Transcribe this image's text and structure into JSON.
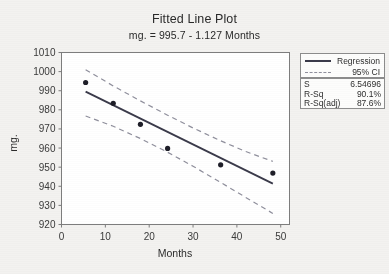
{
  "chart_data": {
    "type": "scatter",
    "title": "Fitted Line Plot",
    "subtitle": "mg.  = 995.7 - 1.127 Months",
    "xlabel": "Months",
    "ylabel": "mg.",
    "xlim": [
      0,
      52
    ],
    "ylim": [
      920,
      1010
    ],
    "xticks": [
      0,
      10,
      20,
      30,
      40,
      50
    ],
    "yticks": [
      920,
      930,
      940,
      950,
      960,
      970,
      980,
      990,
      1000,
      1010
    ],
    "grid": false,
    "legend_position": "right",
    "points": [
      {
        "x": 5.5,
        "y": 994.3
      },
      {
        "x": 11.8,
        "y": 983.4
      },
      {
        "x": 18.0,
        "y": 972.4
      },
      {
        "x": 24.2,
        "y": 959.8
      },
      {
        "x": 36.3,
        "y": 951.2
      },
      {
        "x": 48.2,
        "y": 946.9
      }
    ],
    "fit": {
      "intercept": 995.7,
      "slope": -1.127,
      "x_start": 5.5,
      "x_end": 48.2
    },
    "ci_upper": [
      {
        "x": 5.5,
        "y": 1001.0
      },
      {
        "x": 11.8,
        "y": 992.5
      },
      {
        "x": 18.0,
        "y": 984.7
      },
      {
        "x": 24.2,
        "y": 977.2
      },
      {
        "x": 30.0,
        "y": 970.5
      },
      {
        "x": 36.3,
        "y": 963.8
      },
      {
        "x": 42.0,
        "y": 958.2
      },
      {
        "x": 48.2,
        "y": 953.0
      }
    ],
    "ci_lower": [
      {
        "x": 5.5,
        "y": 976.8
      },
      {
        "x": 11.8,
        "y": 971.4
      },
      {
        "x": 18.0,
        "y": 965.0
      },
      {
        "x": 24.2,
        "y": 957.8
      },
      {
        "x": 30.0,
        "y": 950.5
      },
      {
        "x": 36.3,
        "y": 942.0
      },
      {
        "x": 42.0,
        "y": 934.2
      },
      {
        "x": 48.2,
        "y": 925.8
      }
    ],
    "series_colors": {
      "regression": "#3a3a4a",
      "ci": "#8f8f9c",
      "points": "#1e1e28"
    },
    "legend": [
      {
        "key": "solid",
        "label": "Regression"
      },
      {
        "key": "dashed",
        "label": "95% CI"
      }
    ],
    "stats": [
      {
        "name": "S",
        "value": "6.54696"
      },
      {
        "name": "R-Sq",
        "value": "90.1%"
      },
      {
        "name": "R-Sq(adj)",
        "value": "87.6%"
      }
    ]
  }
}
